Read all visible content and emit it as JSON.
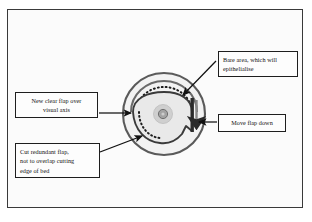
{
  "figure": {
    "frame": {
      "border_color": "#3a3a3a",
      "background": "#fbfbfb"
    }
  },
  "callouts": [
    {
      "id": "bare-area",
      "name": "callout-bare-area",
      "lines": [
        "Bare area, which will",
        "epithelialise"
      ],
      "align": "left",
      "arrow": "points down-left to upper-right rim of flap"
    },
    {
      "id": "new-flap",
      "name": "callout-new-clear-flap",
      "lines": [
        "New clear flap over",
        "visual axis"
      ],
      "align": "center",
      "arrow": "points right to left edge of flap"
    },
    {
      "id": "move-flap",
      "name": "callout-move-flap-down",
      "lines": [
        "Move flap down"
      ],
      "align": "center",
      "arrow": "points left to vertical bar on flap right edge"
    },
    {
      "id": "cut-flap",
      "name": "callout-cut-redundant-flap",
      "lines": [
        "Cut redundant flap,",
        "not to overlap cutting",
        "edge of bed"
      ],
      "align": "left",
      "arrow": "points up-right to lower-left of flap"
    }
  ],
  "diagram": {
    "outer_circle_label": "cornea-limbus-outline",
    "dotted_arc_label": "suture-dotted-arc",
    "flap_label": "corneal-flap-outline",
    "pupil_label": "pupil-visual-axis",
    "bar_label": "flap-edge-bar",
    "down_arrow_label": "flap-move-direction-arrow",
    "colors": {
      "outline": "#555555",
      "flap_fill": "#e9e9e9",
      "iris_fill": "#cccccc",
      "pupil_fill": "#9e9e9e",
      "ink": "#1e1e1e",
      "bar": "#2a2a2a"
    }
  }
}
